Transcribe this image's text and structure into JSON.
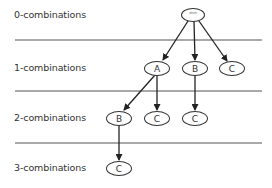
{
  "diagram": {
    "type": "tree",
    "levels": [
      {
        "label": "0-combinations",
        "y": 15
      },
      {
        "label": "1-combinations",
        "y": 68
      },
      {
        "label": "2-combinations",
        "y": 118
      },
      {
        "label": "3-combinations",
        "y": 168
      }
    ],
    "separators_y": [
      40,
      91,
      143
    ],
    "nodes": [
      {
        "id": "root",
        "label": "''''",
        "level": 0,
        "cx": 193,
        "cy": 15
      },
      {
        "id": "A1",
        "label": "A",
        "level": 1,
        "cx": 157,
        "cy": 68
      },
      {
        "id": "B1",
        "label": "B",
        "level": 1,
        "cx": 195,
        "cy": 68
      },
      {
        "id": "C1",
        "label": "C",
        "level": 1,
        "cx": 232,
        "cy": 68
      },
      {
        "id": "AB",
        "label": "B",
        "level": 2,
        "cx": 119,
        "cy": 118
      },
      {
        "id": "AC",
        "label": "C",
        "level": 2,
        "cx": 157,
        "cy": 118
      },
      {
        "id": "BC",
        "label": "C",
        "level": 2,
        "cx": 195,
        "cy": 118
      },
      {
        "id": "ABC",
        "label": "C",
        "level": 3,
        "cx": 119,
        "cy": 168
      }
    ],
    "edges": [
      [
        "root",
        "A1"
      ],
      [
        "root",
        "B1"
      ],
      [
        "root",
        "C1"
      ],
      [
        "A1",
        "AB"
      ],
      [
        "A1",
        "AC"
      ],
      [
        "B1",
        "BC"
      ],
      [
        "AB",
        "ABC"
      ]
    ],
    "colors": {
      "stroke": "#333333",
      "text": "#333333",
      "separator": "#555555",
      "background": "#ffffff"
    }
  }
}
